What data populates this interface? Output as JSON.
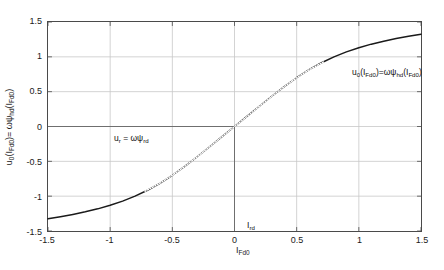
{
  "chart_data": {
    "type": "line",
    "title": "",
    "xlabel": "I_Fd0",
    "ylabel": "u_0(I_Fd0) = omega*psi_hd(I_Fd0)",
    "xlim": [
      -1.5,
      1.5
    ],
    "ylim": [
      -1.5,
      1.5
    ],
    "xticks": [
      -1.5,
      -1,
      -0.5,
      0,
      0.5,
      1,
      1.5
    ],
    "xticklabels": [
      "-1.5",
      "-1",
      "-0.5",
      "0",
      "0.5",
      "1",
      "1.5"
    ],
    "yticks": [
      -1.5,
      -1,
      -0.5,
      0,
      0.5,
      1,
      1.5
    ],
    "yticklabels": [
      "-1.5",
      "-1",
      "-0.5",
      "0",
      "0.5",
      "1",
      "1.5"
    ],
    "grid": true,
    "legend": "none",
    "series": [
      {
        "name": "u0(I_Fd0) saturation curve",
        "style": "solid",
        "color": "#1a1a1a",
        "x": [
          -1.5,
          -1.4,
          -1.3,
          -1.2,
          -1.1,
          -1.0,
          -0.9,
          -0.8,
          -0.7,
          -0.6,
          -0.5,
          -0.4,
          -0.3,
          -0.2,
          -0.1,
          0.0,
          0.1,
          0.2,
          0.3,
          0.4,
          0.5,
          0.6,
          0.7,
          0.8,
          0.9,
          1.0,
          1.1,
          1.2,
          1.3,
          1.4,
          1.5
        ],
        "y": [
          -1.325,
          -1.295,
          -1.262,
          -1.225,
          -1.182,
          -1.131,
          -1.071,
          -1.0,
          -0.915,
          -0.815,
          -0.7,
          -0.572,
          -0.434,
          -0.29,
          -0.145,
          0.0,
          0.145,
          0.29,
          0.434,
          0.572,
          0.7,
          0.815,
          0.915,
          1.0,
          1.071,
          1.131,
          1.182,
          1.225,
          1.262,
          1.295,
          1.325
        ]
      },
      {
        "name": "linear air-gap line",
        "style": "dotted",
        "color": "#1a1a1a",
        "x": [
          -0.72,
          -0.6,
          -0.5,
          -0.4,
          -0.3,
          -0.2,
          -0.1,
          0.0,
          0.1,
          0.2,
          0.3,
          0.4,
          0.5,
          0.6,
          0.72
        ],
        "y": [
          -0.93,
          -0.815,
          -0.7,
          -0.572,
          -0.434,
          -0.29,
          -0.145,
          0.0,
          0.145,
          0.29,
          0.434,
          0.572,
          0.7,
          0.815,
          0.93
        ]
      }
    ],
    "crosshair": {
      "name": "operating-point-crosshair",
      "x": 0.0,
      "y": 0.0,
      "horizontal_from_x": -1.5,
      "vertical_to_y": -1.5,
      "color": "#6e6e6e"
    },
    "annotations": [
      {
        "key": "u_r",
        "text_plain": "u_r = omega*psi_rd",
        "x": 0.0,
        "y": 0.09
      },
      {
        "key": "u_0",
        "text_plain": "u_0(I_Fd0)=omega*psi_hd(I_Fd0)",
        "x": 0.95,
        "y": 1.18
      },
      {
        "key": "I_rd",
        "text_plain": "I_rd",
        "x": 0.0,
        "y": -1.05
      }
    ]
  },
  "axes": {
    "y_tick_labels": [
      "1.5",
      "1",
      "0.5",
      "0",
      "-0.5",
      "-1",
      "-1.5"
    ],
    "x_tick_labels": [
      "-1.5",
      "-1",
      "-0.5",
      "0",
      "0.5",
      "1",
      "1.5"
    ],
    "ylabel_parts": {
      "u": "u",
      "u_sub": "0",
      "open1": "(I",
      "fd1": "Fd0",
      "close1": ")= ",
      "omega": "ωψ",
      "hd": "hd",
      "open2": "(I",
      "fd2": "Fd0",
      "close2": ")"
    },
    "xlabel_parts": {
      "main": "I",
      "sub": "Fd0"
    }
  },
  "annotations": {
    "ur": {
      "main1": "u",
      "sub1": "r",
      "mid": " = ωψ",
      "sub2": "rd"
    },
    "u0": {
      "m1": "u",
      "s1": "0",
      "m2": "(I",
      "s2": "Fd0",
      "m3": ")=ωψ",
      "s3": "hd",
      "m4": "(I",
      "s4": "Fd0",
      "m5": ")"
    },
    "ird": {
      "main": "I",
      "sub": "rd"
    }
  },
  "colors": {
    "curve": "#1a1a1a",
    "grid": "#c8c8c8",
    "axis": "#4a4a4a",
    "crosshair": "#6e6e6e",
    "background": "#ffffff"
  }
}
